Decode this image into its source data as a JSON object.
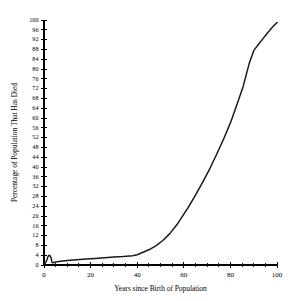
{
  "chart_data": {
    "type": "line",
    "title": "",
    "subtitle": "",
    "xlabel": "Years since Birth of Population",
    "ylabel": "Percentage of Population That Has Died",
    "xlim": [
      0,
      100
    ],
    "ylim": [
      0,
      100
    ],
    "grid": false,
    "legend": null,
    "legend_position": "none",
    "x_major_tick_interval": 20,
    "x_minor_tick_interval": 5,
    "y_major_tick_interval": 4,
    "x_tick_labels": [
      "0",
      "20",
      "40",
      "60",
      "80",
      "100"
    ],
    "x_tick_values": [
      0,
      20,
      40,
      60,
      80,
      100
    ],
    "y_tick_labels": [
      "0",
      "4",
      "8",
      "12",
      "16",
      "20",
      "24",
      "28",
      "32",
      "36",
      "40",
      "44",
      "48",
      "52",
      "56",
      "60",
      "64",
      "68",
      "72",
      "76",
      "80",
      "84",
      "88",
      "92",
      "96",
      "100"
    ],
    "y_tick_values": [
      0,
      4,
      8,
      12,
      16,
      20,
      24,
      28,
      32,
      36,
      40,
      44,
      48,
      52,
      56,
      60,
      64,
      68,
      72,
      76,
      80,
      84,
      88,
      92,
      96,
      100
    ],
    "line_color": "#1a1a1a",
    "series": [
      {
        "name": "Cumulative mortality",
        "x": [
          0,
          0.6,
          1.2,
          1.8,
          2.4,
          3.0,
          3.4,
          3.8,
          4.2,
          5,
          7,
          10,
          14,
          18,
          22,
          26,
          30,
          34,
          38,
          40,
          42,
          45,
          48,
          51,
          54,
          57,
          60,
          62,
          65,
          68,
          71,
          74,
          77,
          80,
          83,
          85.5,
          88,
          90,
          92,
          94,
          96,
          98,
          100
        ],
        "y": [
          0.2,
          0.8,
          2.0,
          3.6,
          4.0,
          3.0,
          1.2,
          0.9,
          1.0,
          1.2,
          1.5,
          1.8,
          2.1,
          2.4,
          2.7,
          3.0,
          3.3,
          3.5,
          3.8,
          4.2,
          5.0,
          6.2,
          7.8,
          10.0,
          12.8,
          16.4,
          20.8,
          23.6,
          28.5,
          33.6,
          39.0,
          45.0,
          51.2,
          58.0,
          66.0,
          73.0,
          82.0,
          87.5,
          90.0,
          92.4,
          94.8,
          97.0,
          99.0
        ]
      }
    ]
  },
  "geometry": {
    "plot_left": 44,
    "plot_right": 277,
    "plot_top": 20,
    "plot_bottom": 265
  }
}
